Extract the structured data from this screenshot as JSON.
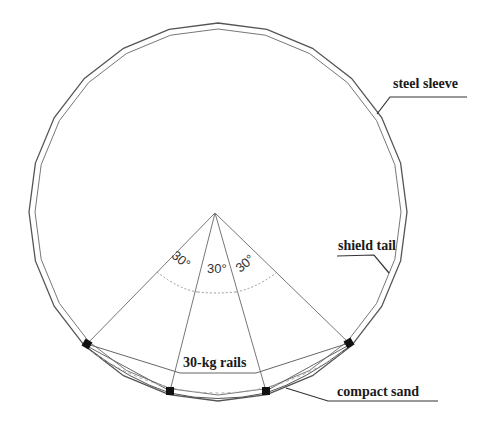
{
  "diagram": {
    "type": "cross-section",
    "labels": {
      "steel_sleeve": "steel sleeve",
      "shield_tail": "shield tail",
      "rails": "30-kg rails",
      "compact_sand": "compact sand"
    },
    "angles": [
      "30°",
      "30°",
      "30°"
    ],
    "colors": {
      "line": "#555555",
      "rail": "#111111",
      "text": "#1a1a1a"
    }
  }
}
